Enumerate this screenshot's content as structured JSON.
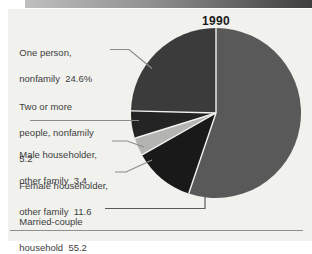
{
  "panel": {
    "background": "#f1f1ee",
    "top_bar_gradient": [
      "#bfbfbf",
      "#3e3e3e"
    ],
    "divider_color": "#8f8f8f"
  },
  "chart_data": {
    "type": "pie",
    "title": "1990",
    "legend_position": "left-labels-with-leader-lines",
    "start": "top",
    "direction": "counterclockwise",
    "separator_color": "#f2f2ef",
    "center": {
      "cx": 216,
      "cy": 113,
      "r": 85
    },
    "slices": [
      {
        "label": "One person, nonfamily",
        "value": 24.6,
        "display": "24.6%",
        "color": "#3b3b3b",
        "lines": [
          "One person,",
          "nonfamily  24.6%"
        ]
      },
      {
        "label": "Two or more people, nonfamily",
        "value": 5.2,
        "display": "5.2",
        "color": "#242424",
        "lines": [
          "Two or more",
          "people, nonfamily",
          "5.2"
        ]
      },
      {
        "label": "Male householder, other family",
        "value": 3.4,
        "display": "3.4",
        "color": "#b4b4b2",
        "lines": [
          "Male householder,",
          "other family  3.4"
        ]
      },
      {
        "label": "Female householder, other family",
        "value": 11.6,
        "display": "11.6",
        "color": "#191919",
        "lines": [
          "Female householder,",
          "other family  11.6"
        ]
      },
      {
        "label": "Married-couple household",
        "value": 55.2,
        "display": "55.2",
        "color": "#595959",
        "lines": [
          "Married-couple",
          "household  55.2"
        ]
      }
    ]
  }
}
